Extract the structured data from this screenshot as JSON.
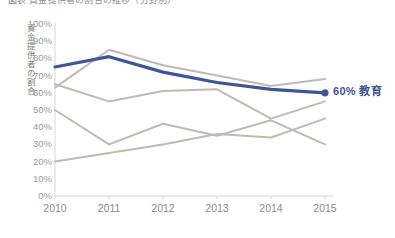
{
  "title": {
    "text": "図表  資金提供者の割合の推移（分野別）"
  },
  "axes": {
    "y_axis_title": "資金提供者の割合",
    "y_ticks": [
      "100%",
      "90%",
      "80%",
      "70%",
      "60%",
      "50%",
      "40%",
      "30%",
      "20%",
      "10%",
      "0%"
    ],
    "x_ticks": [
      "2010",
      "2011",
      "2012",
      "2013",
      "2014",
      "2015"
    ]
  },
  "end_label": {
    "value": "60%",
    "name": "教育",
    "text": "60% 教育"
  },
  "colors": {
    "highlight": "#3d5694",
    "muted": "#bdbbb2",
    "axis": "#d6d6d6",
    "tick_text": "#9a9a9a"
  },
  "chart_data": {
    "type": "line",
    "title": "資金提供者の割合の推移（分野別）",
    "xlabel": "",
    "ylabel": "資金提供者の割合",
    "x": [
      2010,
      2011,
      2012,
      2013,
      2014,
      2015
    ],
    "ylim": [
      0,
      100
    ],
    "xlim": [
      2010,
      2015
    ],
    "grid": false,
    "legend": "none",
    "y_tick_values": [
      0,
      10,
      20,
      30,
      40,
      50,
      60,
      70,
      80,
      90,
      100
    ],
    "series": [
      {
        "name": "教育",
        "color": "#3d5694",
        "highlight": true,
        "end_marker": true,
        "label": "60% 教育",
        "values": [
          75,
          81,
          72,
          66,
          62,
          60
        ]
      },
      {
        "name": "series-2",
        "color": "#bdbbb2",
        "highlight": false,
        "values": [
          63,
          85,
          76,
          70,
          64,
          68
        ]
      },
      {
        "name": "series-3",
        "color": "#bdbbb2",
        "highlight": false,
        "values": [
          65,
          55,
          61,
          62,
          45,
          55
        ]
      },
      {
        "name": "series-4",
        "color": "#bdbbb2",
        "highlight": false,
        "values": [
          50,
          30,
          42,
          35,
          44,
          30
        ]
      },
      {
        "name": "series-5",
        "color": "#bdbbb2",
        "highlight": false,
        "values": [
          20,
          25,
          30,
          36,
          34,
          45
        ]
      }
    ]
  },
  "geometry": {
    "plot_left": 55,
    "plot_right": 325,
    "plot_top": 24,
    "plot_bottom": 196
  }
}
